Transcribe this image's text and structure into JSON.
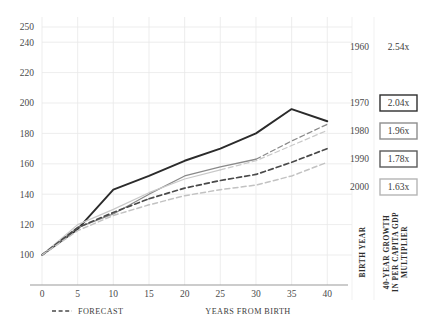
{
  "chart_data": {
    "type": "line",
    "title": "",
    "xlabel": "YEARS FROM BIRTH",
    "ylabel": "",
    "xlim": [
      0,
      41.5
    ],
    "ylim": [
      95,
      250
    ],
    "grid": true,
    "x": [
      0,
      5,
      10,
      15,
      20,
      25,
      30,
      35,
      40
    ],
    "xticks": [
      "0",
      "5",
      "10",
      "15",
      "20",
      "25",
      "30",
      "35",
      "40"
    ],
    "yticks": [
      "100",
      "120",
      "140",
      "160",
      "180",
      "200",
      "220",
      "240",
      "250"
    ],
    "ytick_values": [
      100,
      120,
      140,
      160,
      180,
      200,
      220,
      240,
      250
    ],
    "series": [
      {
        "name": "1960",
        "multiplier": "2.54x",
        "color": "#2b2b2b",
        "style": "solid",
        "width": 1.9,
        "forecast_from": null,
        "values": [
          100,
          117,
          143,
          152,
          162,
          170,
          180,
          196,
          188
        ]
      },
      {
        "name": "1970",
        "multiplier": "2.04x",
        "color": "#8a8a8a",
        "style": "solid",
        "width": 1.3,
        "forecast_from": 30,
        "values": [
          100,
          118,
          127,
          140,
          152,
          158,
          163,
          175,
          186
        ]
      },
      {
        "name": "1980",
        "multiplier": "1.96x",
        "color": "#c9c9c9",
        "style": "solid",
        "width": 1.2,
        "forecast_from": 25,
        "values": [
          100,
          120,
          130,
          141,
          150,
          156,
          162,
          172,
          182
        ]
      },
      {
        "name": "1990",
        "multiplier": "1.78x",
        "color": "#4a4a4a",
        "style": "dashed",
        "width": 1.7,
        "forecast_from": 15,
        "values": [
          100,
          118,
          128,
          137,
          144,
          149,
          153,
          161,
          170
        ]
      },
      {
        "name": "2000",
        "multiplier": "1.63x",
        "color": "#c2c2c2",
        "style": "dashed",
        "width": 1.5,
        "forecast_from": 10,
        "values": [
          100,
          116,
          126,
          133,
          139,
          143,
          146,
          152,
          161
        ]
      }
    ],
    "legend": {
      "position": "bottom-left",
      "entries": [
        {
          "label": "FORECAST",
          "style": "dashed"
        }
      ]
    },
    "side_panel": {
      "birth_year_label": "BIRTH YEAR",
      "growth_label": "40-YEAR GROWTH IN PER CAPITA GDP MULTIPLIER",
      "rows": [
        {
          "year": "1960",
          "multiplier": "2.54x",
          "boxed": false,
          "box_color": "#ffffff"
        },
        {
          "year": "1970",
          "multiplier": "2.04x",
          "boxed": true,
          "box_color": "#2e2e2e"
        },
        {
          "year": "1980",
          "multiplier": "1.96x",
          "boxed": true,
          "box_color": "#8e8e8e"
        },
        {
          "year": "1990",
          "multiplier": "1.78x",
          "boxed": true,
          "box_color": "#5a5a5a"
        },
        {
          "year": "2000",
          "multiplier": "1.63x",
          "boxed": true,
          "box_color": "#b5b5b5"
        }
      ]
    },
    "colors": {
      "grid": "#e9e9e9",
      "axis": "#9a9a9a",
      "text": "#3a3a3a"
    }
  }
}
